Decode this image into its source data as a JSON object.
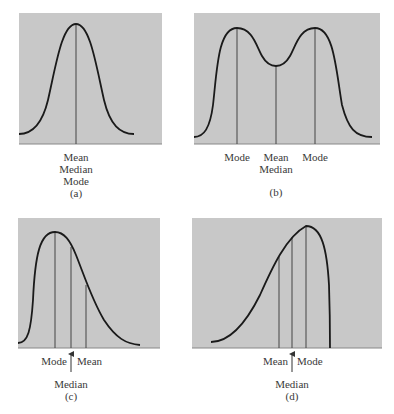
{
  "figure": {
    "panel_background": "#c8c8c8",
    "curve_color": "#1a1a1a",
    "marker_line_color": "#444444",
    "panels": [
      {
        "id": "a",
        "caption": "(a)",
        "shape": "symmetric unimodal",
        "labels": {
          "line1": "Mean",
          "line2": "Median",
          "line3": "Mode"
        }
      },
      {
        "id": "b",
        "caption": "(b)",
        "shape": "symmetric bimodal",
        "labels": {
          "left_mode": "Mode",
          "center_line1": "Mean",
          "center_line2": "Median",
          "right_mode": "Mode"
        }
      },
      {
        "id": "c",
        "caption": "(c)",
        "shape": "right-skewed",
        "labels": {
          "mode": "Mode",
          "mean": "Mean",
          "median": "Median"
        }
      },
      {
        "id": "d",
        "caption": "(d)",
        "shape": "left-skewed",
        "labels": {
          "mean": "Mean",
          "mode": "Mode",
          "median": "Median"
        }
      }
    ]
  }
}
